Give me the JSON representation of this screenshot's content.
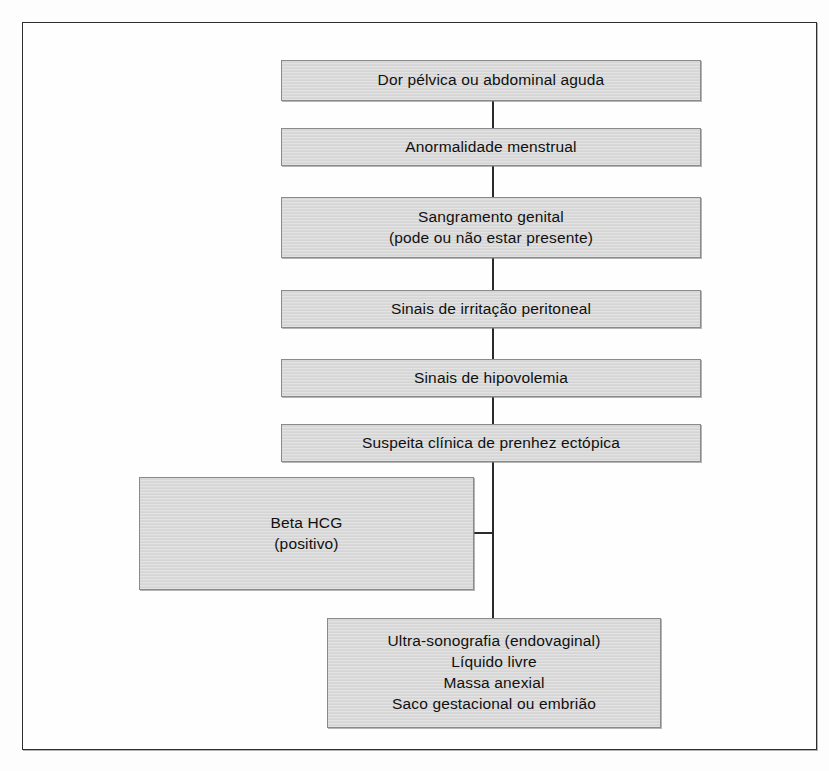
{
  "diagram": {
    "colors": {
      "node_fill": "#d9d9d9",
      "node_border": "#8a8a8a",
      "connector": "#2a2a2a",
      "frame": "#2e2e2e",
      "text": "#101010",
      "background": "#ffffff"
    },
    "nodes": [
      {
        "id": "dor-pelvica",
        "text": "Dor pélvica ou abdominal aguda",
        "x": 281,
        "y": 60,
        "width": 420,
        "height": 41
      },
      {
        "id": "anormalidade-menstrual",
        "text": "Anormalidade menstrual",
        "x": 281,
        "y": 128,
        "width": 420,
        "height": 38
      },
      {
        "id": "sangramento-genital",
        "text": "Sangramento genital\n(pode ou não estar presente)",
        "x": 281,
        "y": 197,
        "width": 420,
        "height": 61
      },
      {
        "id": "irritacao-peritoneal",
        "text": "Sinais de irritação peritoneal",
        "x": 281,
        "y": 290,
        "width": 420,
        "height": 38
      },
      {
        "id": "hipovolemia",
        "text": "Sinais de hipovolemia",
        "x": 281,
        "y": 359,
        "width": 420,
        "height": 38
      },
      {
        "id": "suspeita-clinica",
        "text": "Suspeita clínica de prenhez ectópica",
        "x": 281,
        "y": 424,
        "width": 420,
        "height": 38
      },
      {
        "id": "beta-hcg",
        "text": "Beta HCG\n(positivo)",
        "x": 139,
        "y": 477,
        "width": 335,
        "height": 113
      },
      {
        "id": "ultrassonografia",
        "text": "Ultra-sonografia (endovaginal)\nLíquido livre\nMassa anexial\nSaco gestacional ou embrião",
        "x": 327,
        "y": 618,
        "width": 334,
        "height": 110
      }
    ],
    "connectors": [
      {
        "id": "dor-to-anormalidade",
        "orientation": "v",
        "x": 492,
        "y": 101,
        "length": 27
      },
      {
        "id": "anormalidade-to-sangramento",
        "orientation": "v",
        "x": 492,
        "y": 166,
        "length": 31
      },
      {
        "id": "sangramento-to-irritacao",
        "orientation": "v",
        "x": 492,
        "y": 258,
        "length": 32
      },
      {
        "id": "irritacao-to-hipovolemia",
        "orientation": "v",
        "x": 492,
        "y": 328,
        "length": 31
      },
      {
        "id": "hipovolemia-to-suspeita",
        "orientation": "v",
        "x": 492,
        "y": 397,
        "length": 27
      },
      {
        "id": "suspeita-spine-down",
        "orientation": "v",
        "x": 492,
        "y": 462,
        "length": 156
      },
      {
        "id": "spine-to-beta-hcg",
        "orientation": "h",
        "x": 473,
        "y": 532,
        "length": 21
      }
    ]
  }
}
